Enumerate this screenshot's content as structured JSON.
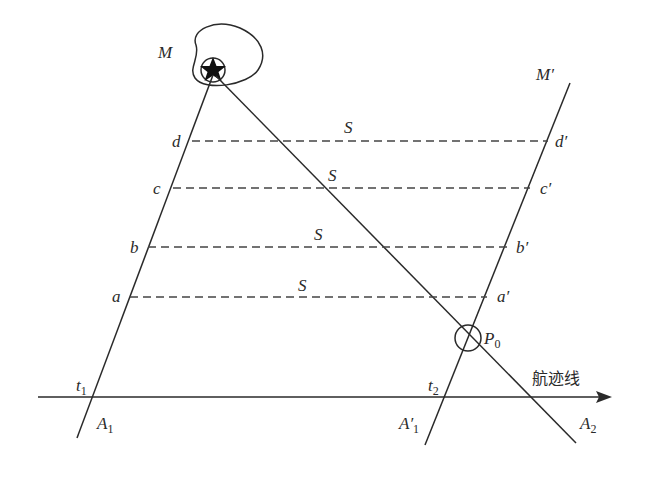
{
  "diagram": {
    "type": "geometry-navigation",
    "labels": {
      "target": "M",
      "target_prime": "M′",
      "d": "d",
      "c": "c",
      "b": "b",
      "a": "a",
      "d_prime": "d′",
      "c_prime": "c′",
      "b_prime": "b′",
      "a_prime": "a′",
      "distance": "S",
      "p0": "P",
      "p0_sub": "0",
      "t1": "t",
      "t1_sub": "1",
      "t2": "t",
      "t2_sub": "2",
      "A1": "A",
      "A1_sub": "1",
      "A1p": "A′",
      "A1p_sub": "1",
      "A2": "A",
      "A2_sub": "2",
      "track": "航迹线"
    },
    "colors": {
      "ink": "#2a2a2a",
      "background": "#ffffff"
    },
    "dashed_lines": [
      {
        "name": "d",
        "y": 141,
        "x1": 192,
        "x2": 548,
        "s_x": 344,
        "s_y": 132
      },
      {
        "name": "c",
        "y": 188,
        "x1": 173,
        "x2": 530,
        "s_x": 328,
        "s_y": 180
      },
      {
        "name": "b",
        "y": 247,
        "x1": 148,
        "x2": 507,
        "s_x": 314,
        "s_y": 239
      },
      {
        "name": "a",
        "y": 297,
        "x1": 130,
        "x2": 487,
        "s_x": 298,
        "s_y": 290
      }
    ]
  }
}
